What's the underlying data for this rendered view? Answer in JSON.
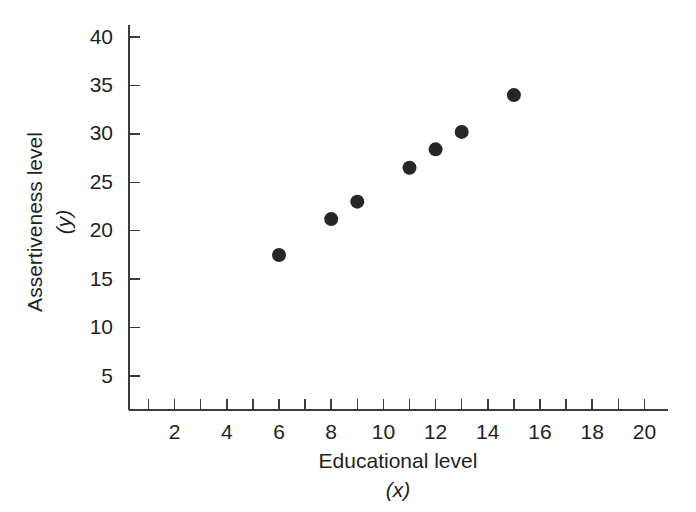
{
  "chart_data": {
    "type": "scatter",
    "title": "",
    "xlabel": "Educational level",
    "xlabel_sub": "(x)",
    "ylabel": "Assertiveness level",
    "ylabel_sub": "(y)",
    "xlim": [
      0,
      21
    ],
    "ylim": [
      0,
      41.5
    ],
    "grid": false,
    "legend": null,
    "x_major_ticks": [
      2,
      4,
      6,
      8,
      10,
      12,
      14,
      16,
      18,
      20
    ],
    "x_minor_ticks": [
      1,
      3,
      5,
      7,
      9,
      11,
      13,
      15,
      17,
      19
    ],
    "x_tick_labels": [
      "2",
      "4",
      "6",
      "8",
      "10",
      "12",
      "14",
      "16",
      "18",
      "20"
    ],
    "y_ticks": [
      5,
      10,
      15,
      20,
      25,
      30,
      35,
      40
    ],
    "y_tick_labels": [
      "5",
      "10",
      "15",
      "20",
      "25",
      "30",
      "35",
      "40"
    ],
    "point_color": "#262626",
    "axis_color": "#3b3b3b",
    "background_color": "#ffffff",
    "x": [
      6,
      8,
      9,
      11,
      12,
      13,
      15
    ],
    "y": [
      17.5,
      21.2,
      23.0,
      26.5,
      28.4,
      30.2,
      34.0
    ],
    "points": [
      {
        "x": 6,
        "y": 17.5
      },
      {
        "x": 8,
        "y": 21.2
      },
      {
        "x": 9,
        "y": 23.0
      },
      {
        "x": 11,
        "y": 26.5
      },
      {
        "x": 12,
        "y": 28.4
      },
      {
        "x": 13,
        "y": 30.2
      },
      {
        "x": 15,
        "y": 34.0
      }
    ]
  }
}
